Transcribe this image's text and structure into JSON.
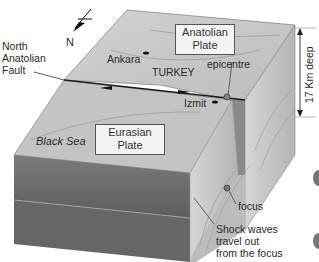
{
  "diagram": {
    "type": "block-diagram",
    "compass": {
      "label": "N",
      "icon": "north-arrow-icon"
    },
    "labels": {
      "fault": [
        "North",
        "Anatolian",
        "Fault"
      ],
      "anatolian_plate": [
        "Anatolian",
        "Plate"
      ],
      "eurasian_plate": [
        "Eurasian",
        "Plate"
      ],
      "city_ankara": "Ankara",
      "country": "TURKEY",
      "epicentre": "epicentre",
      "city_izmit": "Izmit",
      "sea": "Black Sea",
      "depth": "17 Km deep",
      "focus": "focus",
      "shock_waves": [
        "Shock waves",
        "travel out",
        "from the focus"
      ]
    },
    "colors": {
      "top_surface": "#c9c9c9",
      "side_dark": "#6e6e6e",
      "side_light": "#bdbdbd",
      "fault_line": "#1a1a1a",
      "label_box": "#f4f4f4"
    }
  }
}
